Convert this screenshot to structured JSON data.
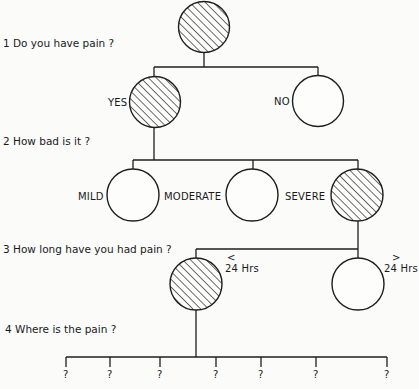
{
  "diagram": {
    "type": "decision-tree",
    "questions": [
      {
        "number": "1",
        "text": "1 Do you have pain ?"
      },
      {
        "number": "2",
        "text": "2 How bad is it ?"
      },
      {
        "number": "3",
        "text": "3 How long have you had pain ?"
      },
      {
        "number": "4",
        "text": "4 Where is the pain ?"
      }
    ],
    "level1": {
      "root": {
        "selected": true
      },
      "options": [
        {
          "label": "YES",
          "selected": true
        },
        {
          "label": "NO",
          "selected": false
        }
      ]
    },
    "level2": {
      "options": [
        {
          "label": "MILD",
          "selected": false
        },
        {
          "label": "MODERATE",
          "selected": false
        },
        {
          "label": "SEVERE",
          "selected": true
        }
      ]
    },
    "level3": {
      "options": [
        {
          "symbol": "<",
          "label": "24 Hrs",
          "selected": true
        },
        {
          "symbol": ">",
          "label": "24 Hrs",
          "selected": false
        }
      ]
    },
    "level4": {
      "options": [
        "?",
        "?",
        "?",
        "?",
        "?",
        "?",
        "?"
      ]
    },
    "legend": {
      "hatched": "selected answer",
      "open": "unselected answer"
    }
  }
}
